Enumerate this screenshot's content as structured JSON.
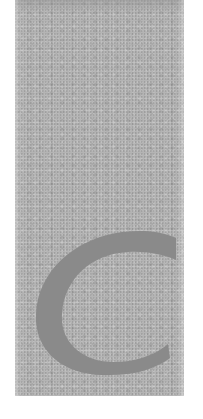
{
  "panel": {
    "texture": "granite-speckle",
    "base_color": "#b4b4b4",
    "letter": "C",
    "letter_color": "#8a8a8a"
  }
}
